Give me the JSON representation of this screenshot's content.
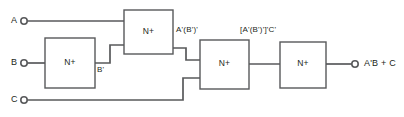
{
  "diagram": {
    "type": "logic-circuit-schematic",
    "colors": {
      "wire": "#58595b",
      "text": "#231f20",
      "background": "#ffffff"
    },
    "inputs": [
      {
        "name": "input-a",
        "label": "A",
        "x": 13,
        "y": 17,
        "terminal_x": 23,
        "terminal_y": 21
      },
      {
        "name": "input-b",
        "label": "B",
        "x": 13,
        "y": 59,
        "terminal_x": 23,
        "terminal_y": 63
      },
      {
        "name": "input-c",
        "label": "C",
        "x": 13,
        "y": 96,
        "terminal_x": 23,
        "terminal_y": 100
      }
    ],
    "gates": [
      {
        "name": "nor-gate-1",
        "label": "N+",
        "x": 45,
        "y": 38,
        "w": 50,
        "h": 50
      },
      {
        "name": "nor-gate-2",
        "label": "N+",
        "x": 124,
        "y": 10,
        "w": 49,
        "h": 44
      },
      {
        "name": "nor-gate-3",
        "label": "N+",
        "x": 200,
        "y": 40,
        "w": 49,
        "h": 49
      },
      {
        "name": "nor-gate-4",
        "label": "N+",
        "x": 280,
        "y": 42,
        "w": 46,
        "h": 46
      }
    ],
    "signals": [
      {
        "name": "signal-b-not",
        "label": "B'",
        "x": 97,
        "y": 67
      },
      {
        "name": "signal-a-nor-bnot",
        "label": "A'(B')'",
        "x": 176,
        "y": 26
      },
      {
        "name": "signal-nor-c",
        "label": "[A'(B')']'C'",
        "x": 240,
        "y": 27
      }
    ],
    "output": {
      "name": "output-expression",
      "label": "A'B + C",
      "x": 366,
      "y": 59,
      "terminal_x": 355,
      "terminal_y": 64
    }
  }
}
